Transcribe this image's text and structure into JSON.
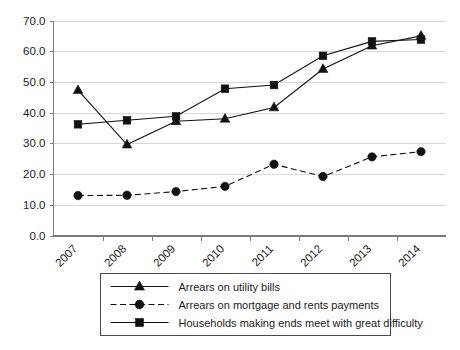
{
  "chart_data": {
    "type": "line",
    "title": "",
    "subtitle": "",
    "xlabel": "",
    "ylabel": "",
    "x": [
      "2007",
      "2008",
      "2009",
      "2010",
      "2011",
      "2012",
      "2013",
      "2014"
    ],
    "categories": [
      "2007",
      "2008",
      "2009",
      "2010",
      "2011",
      "2012",
      "2013",
      "2014"
    ],
    "ylim": [
      0.0,
      70.0
    ],
    "yticks": [
      "0.0",
      "10.0",
      "20.0",
      "30.0",
      "40.0",
      "50.0",
      "60.0",
      "70.0"
    ],
    "ytick_values": [
      0.0,
      10.0,
      20.0,
      30.0,
      40.0,
      50.0,
      60.0,
      70.0
    ],
    "grid": true,
    "grid_axis": "y",
    "legend_position": "bottom",
    "series": [
      {
        "name": "Arrears on utility bills",
        "marker": "triangle",
        "linestyle": "solid",
        "color": "#111111",
        "values": [
          47.3,
          29.6,
          37.2,
          38.0,
          41.7,
          54.2,
          61.8,
          65.0
        ]
      },
      {
        "name": "Arrears on mortgage and rents payments",
        "marker": "circle",
        "linestyle": "dashed",
        "color": "#111111",
        "values": [
          13.0,
          13.1,
          14.3,
          16.0,
          23.2,
          19.2,
          25.6,
          27.3
        ]
      },
      {
        "name": "Households making ends meet with great difficulty",
        "marker": "square",
        "linestyle": "solid",
        "color": "#111111",
        "values": [
          36.2,
          37.5,
          38.8,
          47.8,
          49.0,
          58.5,
          63.2,
          63.8
        ]
      }
    ]
  },
  "legend": {
    "items": [
      {
        "label": "Arrears on utility bills",
        "marker": "triangle",
        "linestyle": "solid"
      },
      {
        "label": "Arrears on mortgage and rents payments",
        "marker": "circle",
        "linestyle": "dashed"
      },
      {
        "label": "Households making ends meet with great difficulty",
        "marker": "square",
        "linestyle": "solid"
      }
    ]
  },
  "colors": {
    "series": "#111111",
    "grid": "#d8d8d8",
    "axis": "#7a7a7a",
    "text": "#1a1a1a",
    "background": "#ffffff",
    "legend_border": "#4a4a4a"
  }
}
